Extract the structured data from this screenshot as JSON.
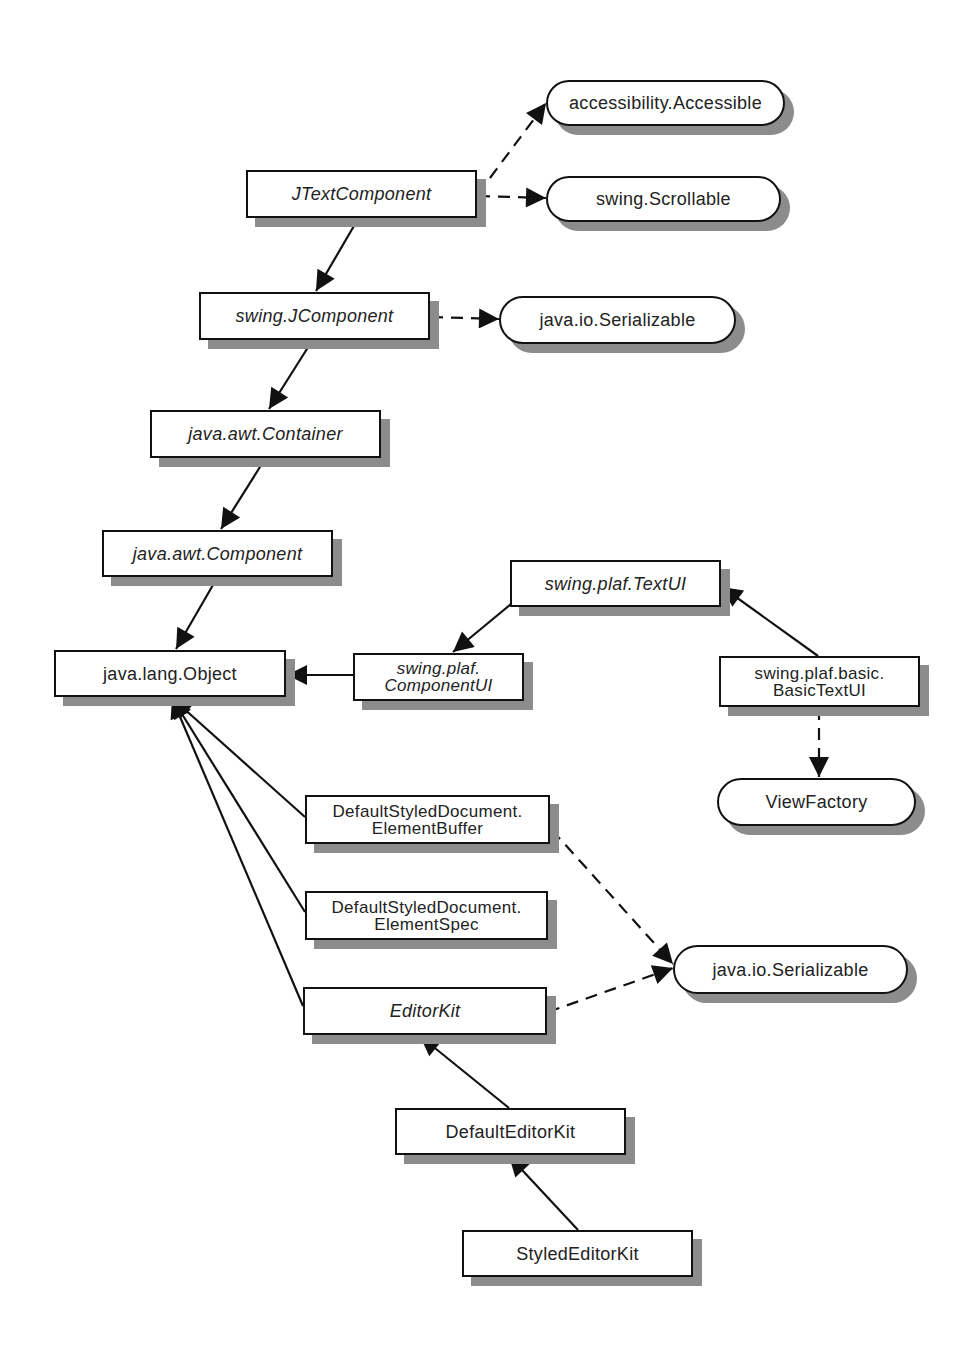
{
  "diagram": {
    "type": "uml-class-hierarchy",
    "legend": {
      "solid_arrow": "extends (inheritance)",
      "dashed_arrow": "implements (interface)",
      "rectangle": "class",
      "italic_text": "abstract class",
      "rounded_pill": "interface"
    },
    "nodes": [
      {
        "id": "jtextcomponent",
        "label": "JTextComponent",
        "kind": "class",
        "abstract": true,
        "x": 246,
        "y": 170,
        "w": 231,
        "h": 48
      },
      {
        "id": "accessible",
        "label": "accessibility.Accessible",
        "kind": "interface",
        "abstract": false,
        "x": 546,
        "y": 80,
        "w": 239,
        "h": 46
      },
      {
        "id": "scrollable",
        "label": "swing.Scrollable",
        "kind": "interface",
        "abstract": false,
        "x": 546,
        "y": 176,
        "w": 235,
        "h": 46
      },
      {
        "id": "jcomponent",
        "label": "swing.JComponent",
        "kind": "class",
        "abstract": true,
        "x": 199,
        "y": 292,
        "w": 231,
        "h": 48
      },
      {
        "id": "serializable1",
        "label": "java.io.Serializable",
        "kind": "interface",
        "abstract": false,
        "x": 499,
        "y": 296,
        "w": 237,
        "h": 48
      },
      {
        "id": "container",
        "label": "java.awt.Container",
        "kind": "class",
        "abstract": true,
        "x": 150,
        "y": 410,
        "w": 231,
        "h": 48
      },
      {
        "id": "component",
        "label": "java.awt.Component",
        "kind": "class",
        "abstract": true,
        "x": 102,
        "y": 530,
        "w": 231,
        "h": 47
      },
      {
        "id": "object",
        "label": "java.lang.Object",
        "kind": "class",
        "abstract": false,
        "x": 54,
        "y": 650,
        "w": 232,
        "h": 47
      },
      {
        "id": "componentui",
        "label": "swing.plaf.\nComponentUI",
        "kind": "class",
        "abstract": true,
        "x": 353,
        "y": 653,
        "w": 171,
        "h": 48
      },
      {
        "id": "textui",
        "label": "swing.plaf.TextUI",
        "kind": "class",
        "abstract": true,
        "x": 510,
        "y": 560,
        "w": 211,
        "h": 47
      },
      {
        "id": "basictextui",
        "label": "swing.plaf.basic.\nBasicTextUI",
        "kind": "class",
        "abstract": false,
        "x": 719,
        "y": 656,
        "w": 201,
        "h": 51
      },
      {
        "id": "viewfactory",
        "label": "ViewFactory",
        "kind": "interface",
        "abstract": false,
        "x": 717,
        "y": 778,
        "w": 199,
        "h": 48
      },
      {
        "id": "elementbuffer",
        "label": "DefaultStyledDocument.\nElementBuffer",
        "kind": "class",
        "abstract": false,
        "x": 305,
        "y": 795,
        "w": 245,
        "h": 49
      },
      {
        "id": "elementspec",
        "label": "DefaultStyledDocument.\nElementSpec",
        "kind": "class",
        "abstract": false,
        "x": 305,
        "y": 891,
        "w": 243,
        "h": 49
      },
      {
        "id": "serializable2",
        "label": "java.io.Serializable",
        "kind": "interface",
        "abstract": false,
        "x": 673,
        "y": 945,
        "w": 235,
        "h": 49
      },
      {
        "id": "editorkit",
        "label": "EditorKit",
        "kind": "class",
        "abstract": true,
        "x": 303,
        "y": 987,
        "w": 244,
        "h": 48
      },
      {
        "id": "defaulteditorkit",
        "label": "DefaultEditorKit",
        "kind": "class",
        "abstract": false,
        "x": 395,
        "y": 1108,
        "w": 231,
        "h": 47
      },
      {
        "id": "stylededitorkit",
        "label": "StyledEditorKit",
        "kind": "class",
        "abstract": false,
        "x": 462,
        "y": 1230,
        "w": 231,
        "h": 47
      }
    ],
    "edges": [
      {
        "from": "jtextcomponent",
        "to": "accessible",
        "style": "dashed",
        "x1": 478,
        "y1": 194,
        "x2": 546,
        "y2": 103
      },
      {
        "from": "jtextcomponent",
        "to": "scrollable",
        "style": "dashed",
        "x1": 478,
        "y1": 196,
        "x2": 546,
        "y2": 198
      },
      {
        "from": "jtextcomponent",
        "to": "jcomponent",
        "style": "solid",
        "x1": 358,
        "y1": 219,
        "x2": 316,
        "y2": 291
      },
      {
        "from": "jcomponent",
        "to": "serializable1",
        "style": "dashed",
        "x1": 431,
        "y1": 317,
        "x2": 499,
        "y2": 319
      },
      {
        "from": "jcomponent",
        "to": "container",
        "style": "solid",
        "x1": 312,
        "y1": 341,
        "x2": 269,
        "y2": 409
      },
      {
        "from": "container",
        "to": "component",
        "style": "solid",
        "x1": 265,
        "y1": 459,
        "x2": 221,
        "y2": 529
      },
      {
        "from": "component",
        "to": "object",
        "style": "solid",
        "x1": 217,
        "y1": 578,
        "x2": 176,
        "y2": 649
      },
      {
        "from": "componentui",
        "to": "object",
        "style": "solid",
        "x1": 353,
        "y1": 675,
        "x2": 287,
        "y2": 675
      },
      {
        "from": "textui",
        "to": "componentui",
        "style": "solid",
        "x1": 534,
        "y1": 585,
        "x2": 453,
        "y2": 652
      },
      {
        "from": "basictextui",
        "to": "textui",
        "style": "solid",
        "x1": 818,
        "y1": 656,
        "x2": 722,
        "y2": 587
      },
      {
        "from": "basictextui",
        "to": "viewfactory",
        "style": "dashed",
        "x1": 819,
        "y1": 708,
        "x2": 819,
        "y2": 777
      },
      {
        "from": "elementbuffer",
        "to": "object",
        "style": "solid",
        "x1": 305,
        "y1": 817,
        "x2": 172,
        "y2": 698
      },
      {
        "from": "elementspec",
        "to": "object",
        "style": "solid",
        "x1": 305,
        "y1": 912,
        "x2": 172,
        "y2": 698
      },
      {
        "from": "editorkit",
        "to": "object",
        "style": "solid",
        "x1": 303,
        "y1": 1006,
        "x2": 172,
        "y2": 698
      },
      {
        "from": "elementbuffer",
        "to": "serializable2",
        "style": "dashed",
        "x1": 552,
        "y1": 830,
        "x2": 673,
        "y2": 964
      },
      {
        "from": "editorkit",
        "to": "serializable2",
        "style": "dashed",
        "x1": 548,
        "y1": 1012,
        "x2": 673,
        "y2": 968
      },
      {
        "from": "defaulteditorkit",
        "to": "editorkit",
        "style": "solid",
        "x1": 509,
        "y1": 1108,
        "x2": 420,
        "y2": 1036
      },
      {
        "from": "stylededitorkit",
        "to": "defaulteditorkit",
        "style": "solid",
        "x1": 578,
        "y1": 1230,
        "x2": 509,
        "y2": 1156
      }
    ],
    "colors": {
      "stroke": "#111111",
      "fill": "#ffffff",
      "shadow": "#8c8c8c",
      "text": "#222222"
    }
  }
}
